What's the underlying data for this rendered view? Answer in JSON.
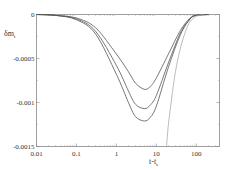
{
  "chart_data": {
    "type": "line",
    "title": "",
    "xlabel": "t-t_s",
    "ylabel": "δm_t",
    "xscale": "log",
    "xlim": [
      0.01,
      380
    ],
    "ylim": [
      -0.0015,
      0
    ],
    "grid": false,
    "legend": null,
    "x_ticks": [
      {
        "value": 0.01,
        "label": "0.01"
      },
      {
        "value": 0.1,
        "label": "0.1"
      },
      {
        "value": 1,
        "label": "1"
      },
      {
        "value": 10,
        "label": "10"
      },
      {
        "value": 100,
        "label": "100"
      }
    ],
    "y_ticks": [
      {
        "value": 0,
        "label": "0"
      },
      {
        "value": -0.0005,
        "label": "-0.0005"
      },
      {
        "value": -0.001,
        "label": "-0.001"
      },
      {
        "value": -0.0015,
        "label": "-0.0015"
      }
    ],
    "series": [
      {
        "name": "curve-1 (shallow)",
        "color": "#555555",
        "x": [
          0.01,
          0.03,
          0.1,
          0.3,
          1,
          2,
          3,
          5,
          7,
          10,
          20,
          40,
          70,
          100,
          200
        ],
        "y": [
          0,
          -1e-05,
          -4e-05,
          -0.00015,
          -0.00045,
          -0.00065,
          -0.00078,
          -0.00085,
          -0.00082,
          -0.00072,
          -0.00045,
          -0.00018,
          -4e-05,
          -1e-05,
          0
        ]
      },
      {
        "name": "curve-2 (middle)",
        "color": "#555555",
        "x": [
          0.01,
          0.03,
          0.1,
          0.3,
          1,
          2,
          3,
          5,
          7,
          10,
          20,
          40,
          70,
          100,
          200
        ],
        "y": [
          0,
          -1e-05,
          -5e-05,
          -0.00019,
          -0.00058,
          -0.00087,
          -0.00102,
          -0.00107,
          -0.00103,
          -0.00092,
          -0.00055,
          -0.00021,
          -5e-05,
          -1e-05,
          0
        ]
      },
      {
        "name": "curve-3 (deep)",
        "color": "#555555",
        "x": [
          0.01,
          0.03,
          0.1,
          0.3,
          1,
          2,
          3,
          5,
          7,
          10,
          20,
          40,
          70,
          100,
          200
        ],
        "y": [
          0,
          -1e-05,
          -6e-05,
          -0.00022,
          -0.00068,
          -0.001,
          -0.00116,
          -0.00121,
          -0.00117,
          -0.00104,
          -0.0006,
          -0.00023,
          -5e-05,
          -1e-05,
          0
        ]
      },
      {
        "name": "curve-4 (asymptotic)",
        "color": "#aaaaaa",
        "x": [
          18,
          20,
          25,
          30,
          40,
          55,
          70,
          100,
          150
        ],
        "y": [
          -0.0015,
          -0.00125,
          -0.0009,
          -0.00065,
          -0.00038,
          -0.00018,
          -8e-05,
          -2e-05,
          0
        ]
      }
    ]
  }
}
